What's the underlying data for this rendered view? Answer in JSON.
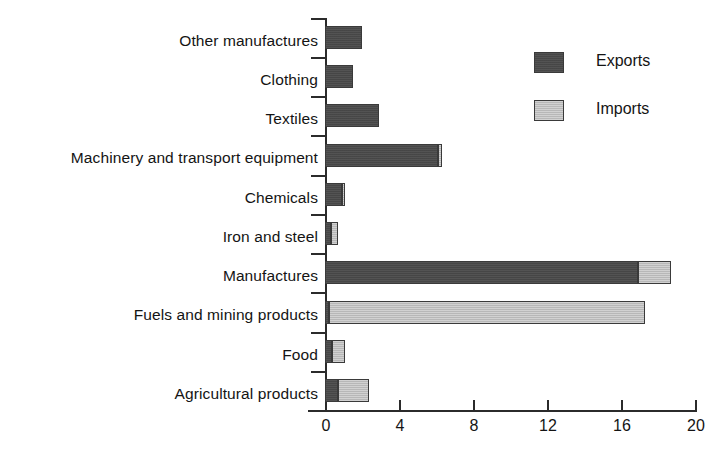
{
  "chart_data": {
    "type": "bar",
    "orientation": "horizontal",
    "stacked": false,
    "title": "",
    "xlabel": "",
    "ylabel": "",
    "xlim": [
      0,
      20
    ],
    "xticks": [
      0,
      4,
      8,
      12,
      16,
      20
    ],
    "xtick_labels": [
      "0",
      "4",
      "8",
      "12",
      "16",
      "20"
    ],
    "grid": false,
    "legend_position": "top-right",
    "categories": [
      "Other manufactures",
      "Clothing",
      "Textiles",
      "Machinery and transport equipment",
      "Chemicals",
      "Iron and steel",
      "Manufactures",
      "Fuels and mining products",
      "Food",
      "Agricultural products"
    ],
    "series": [
      {
        "name": "Exports",
        "color": "#4a4a4a",
        "values": [
          2.0,
          1.5,
          2.9,
          6.1,
          0.9,
          0.3,
          16.9,
          0.2,
          0.4,
          0.7
        ]
      },
      {
        "name": "Imports",
        "color": "#c2c2c2",
        "values": [
          0.0,
          0.0,
          0.0,
          0.2,
          0.2,
          0.4,
          1.8,
          17.1,
          0.7,
          1.7
        ]
      }
    ],
    "legend": [
      {
        "label": "Exports",
        "swatch": "#4a4a4a"
      },
      {
        "label": "Imports",
        "swatch": "#c2c2c2"
      }
    ]
  },
  "colors": {
    "exports": "#4a4a4a",
    "imports": "#c2c2c2",
    "axis": "#2b2b2b",
    "text": "#141414",
    "background": "#ffffff"
  }
}
